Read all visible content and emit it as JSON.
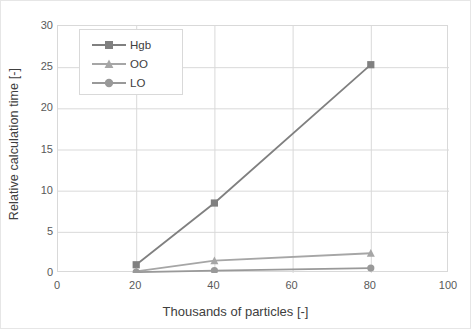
{
  "chart_data": {
    "type": "line",
    "title": "",
    "xlabel": "Thousands of particles [-]",
    "ylabel": "Relative calculation time [-]",
    "x": [
      20,
      40,
      80
    ],
    "xlim": [
      0,
      100
    ],
    "ylim": [
      0,
      30
    ],
    "xticks": [
      "0",
      "20",
      "40",
      "60",
      "80",
      "100"
    ],
    "yticks": [
      "0",
      "5",
      "10",
      "15",
      "20",
      "25",
      "30"
    ],
    "grid": "both",
    "legend_position": "upper-left-inside",
    "series": [
      {
        "name": "Hgb",
        "marker": "square",
        "color": "#808080",
        "values": [
          1.0,
          8.5,
          25.3
        ]
      },
      {
        "name": "OO",
        "marker": "triangle",
        "color": "#a6a6a6",
        "values": [
          0.2,
          1.5,
          2.4
        ]
      },
      {
        "name": "LO",
        "marker": "circle",
        "color": "#999999",
        "values": [
          0.1,
          0.3,
          0.6
        ]
      }
    ]
  },
  "axes": {
    "y_title": "Relative calculation time [-]",
    "x_title": "Thousands of particles [-]",
    "y_ticks": [
      "30",
      "25",
      "20",
      "15",
      "10",
      "5",
      "0"
    ],
    "x_ticks": [
      "0",
      "20",
      "40",
      "60",
      "80",
      "100"
    ]
  },
  "legend": {
    "items": [
      {
        "label": "Hgb",
        "icon": "square-marker-icon",
        "color": "#808080"
      },
      {
        "label": "OO",
        "icon": "triangle-marker-icon",
        "color": "#a6a6a6"
      },
      {
        "label": "LO",
        "icon": "circle-marker-icon",
        "color": "#999999"
      }
    ]
  },
  "colors": {
    "grid": "#d9d9d9",
    "border": "#d9d9d9",
    "tick_text": "#595959",
    "title_text": "#404040",
    "background": "#ffffff"
  }
}
